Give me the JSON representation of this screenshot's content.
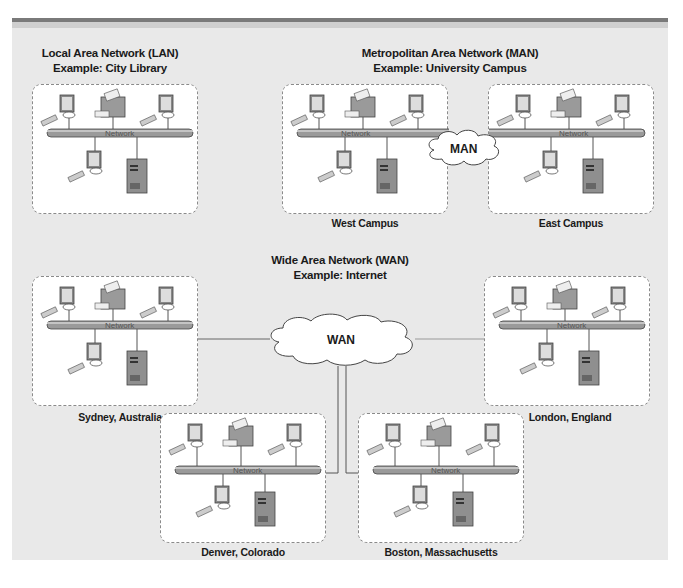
{
  "sections": {
    "lan": {
      "title": "Local Area Network (LAN)",
      "example": "Example: City Library"
    },
    "man": {
      "title": "Metropolitan Area Network (MAN)",
      "example": "Example: University Campus",
      "cloud_label": "MAN",
      "sites": [
        {
          "caption": "West Campus"
        },
        {
          "caption": "East Campus"
        }
      ]
    },
    "wan": {
      "title": "Wide Area Network (WAN)",
      "example": "Example: Internet",
      "cloud_label": "WAN",
      "sites": [
        {
          "caption": "Sydney, Australia"
        },
        {
          "caption": "London, England"
        },
        {
          "caption": "Denver, Colorado"
        },
        {
          "caption": "Boston, Massachusetts"
        }
      ]
    }
  },
  "bus_label": "Network",
  "node_icons": [
    "computer-icon",
    "printer-icon",
    "computer-icon",
    "computer-icon",
    "server-icon"
  ],
  "colors": {
    "panel": "#e9e9e9",
    "box_fill": "#ffffff",
    "box_border": "#8a8a8a",
    "bus": "#9a9a9a",
    "text": "#1a1a1a"
  }
}
